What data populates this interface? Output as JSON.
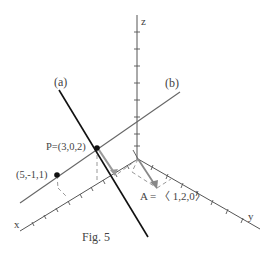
{
  "figure": {
    "caption": "Fig. 5",
    "axes": {
      "x_label": "x",
      "y_label": "y",
      "z_label": "z",
      "origin": [
        138,
        159
      ],
      "x_end": [
        20,
        231
      ],
      "y_end": [
        260,
        229
      ],
      "z_end": [
        137,
        15
      ],
      "color": "#555555"
    },
    "lines": [
      {
        "label": "(a)",
        "from": [
          59,
          90
        ],
        "to": [
          148,
          237
        ],
        "color": "#111111",
        "width": 1.6
      },
      {
        "label": "(b)",
        "from": [
          20,
          203
        ],
        "to": [
          180,
          92
        ],
        "color": "#666666",
        "width": 1.1
      }
    ],
    "points": [
      {
        "label": "P=(3,0,2)",
        "xy": [
          97,
          148
        ]
      },
      {
        "label": "(5,-1,1)",
        "xy": [
          57,
          175
        ]
      }
    ],
    "vector": {
      "label": "A = 〈 1,2,0〉",
      "from": [
        138,
        159
      ],
      "to": [
        157,
        188
      ],
      "color": "#888888"
    },
    "labels": {
      "line_a": "(a)",
      "line_b": "(b)",
      "point_p": "P=(3,0,2)",
      "point_q": "(5,-1,1)",
      "vector_a": "A = 〈 1,2,0〉",
      "caption": "Fig. 5",
      "x": "x",
      "y": "y",
      "z": "z"
    }
  }
}
